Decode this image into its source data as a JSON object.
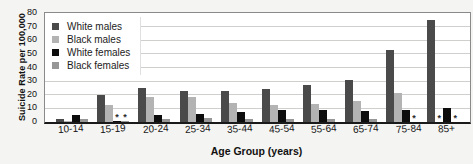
{
  "chart": {
    "y_axis_title": "Suicide Rate per 100,000",
    "x_axis_title": "Age Group (years)",
    "suppressed_marker": "*"
  },
  "chart_data": {
    "type": "bar",
    "title": "",
    "xlabel": "Age Group (years)",
    "ylabel": "Suicide Rate per 100,000",
    "ylim": [
      0,
      80
    ],
    "yticks": [
      0,
      10,
      20,
      30,
      40,
      50,
      60,
      70,
      80
    ],
    "grid": true,
    "legend_position": "top-left-inside",
    "categories": [
      "10-14",
      "15-19",
      "20-24",
      "25-34",
      "35-44",
      "45-54",
      "55-64",
      "65-74",
      "75-84",
      "85+"
    ],
    "series": [
      {
        "name": "White males",
        "color": "#4a4a4a",
        "values": [
          2.5,
          20,
          25,
          23,
          23,
          24,
          27,
          31,
          53,
          75
        ],
        "suppressed": [
          false,
          false,
          false,
          false,
          false,
          false,
          false,
          false,
          false,
          false
        ]
      },
      {
        "name": "Black males",
        "color": "#b3b3b3",
        "values": [
          1,
          12.5,
          18.5,
          18,
          14,
          12.5,
          13.5,
          15.5,
          21.5,
          null
        ],
        "suppressed": [
          false,
          false,
          false,
          false,
          false,
          false,
          false,
          false,
          false,
          true
        ]
      },
      {
        "name": "White females",
        "color": "#0d0d0d",
        "values": [
          5.5,
          1,
          5,
          6,
          7.5,
          9,
          9,
          8,
          9,
          10
        ],
        "suppressed": [
          false,
          true,
          false,
          false,
          false,
          false,
          false,
          false,
          false,
          false
        ]
      },
      {
        "name": "Black females",
        "color": "#979797",
        "values": [
          2.5,
          0.5,
          2,
          3,
          2,
          2.5,
          2.5,
          2,
          null,
          null
        ],
        "suppressed": [
          false,
          true,
          false,
          false,
          false,
          false,
          false,
          false,
          true,
          true
        ]
      }
    ]
  }
}
